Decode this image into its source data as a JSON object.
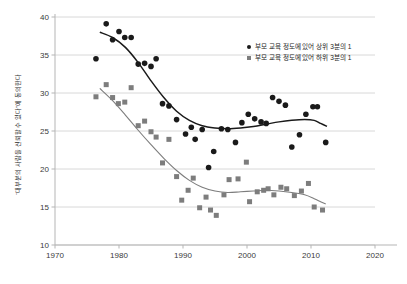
{
  "chart_data": {
    "type": "scatter",
    "title": "",
    "xlabel": "",
    "ylabel": "“대부분의 사람을 신뢰할 수 있다”에 동의한다",
    "xlim": [
      1970,
      2020
    ],
    "ylim": [
      10,
      40
    ],
    "xticks": [
      1970,
      1980,
      1990,
      2000,
      2010,
      2020
    ],
    "yticks": [
      10,
      15,
      20,
      25,
      30,
      35,
      40
    ],
    "grid": "horizontal",
    "legend_position": "top-right",
    "series": [
      {
        "name": "부모 교육 정도에 있어 상위 3분의 1",
        "marker": "circle",
        "color": "#1a1a1a",
        "points": [
          [
            1976.4,
            34.5
          ],
          [
            1978.0,
            39.1
          ],
          [
            1979.0,
            37.0
          ],
          [
            1980.0,
            38.1
          ],
          [
            1980.9,
            37.3
          ],
          [
            1981.9,
            37.3
          ],
          [
            1983.0,
            33.8
          ],
          [
            1984.0,
            33.9
          ],
          [
            1985.0,
            33.5
          ],
          [
            1985.8,
            34.5
          ],
          [
            1986.8,
            28.6
          ],
          [
            1987.8,
            28.3
          ],
          [
            1989.0,
            26.5
          ],
          [
            1990.4,
            24.6
          ],
          [
            1991.3,
            25.5
          ],
          [
            1991.9,
            23.9
          ],
          [
            1993.0,
            25.2
          ],
          [
            1994.0,
            20.2
          ],
          [
            1994.8,
            22.3
          ],
          [
            1996.0,
            25.3
          ],
          [
            1997.0,
            25.2
          ],
          [
            1998.2,
            23.5
          ],
          [
            1999.2,
            26.1
          ],
          [
            2000.2,
            27.2
          ],
          [
            2001.2,
            26.6
          ],
          [
            2002.2,
            26.2
          ],
          [
            2003.0,
            26.0
          ],
          [
            2004.0,
            29.4
          ],
          [
            2005.0,
            28.9
          ],
          [
            2006.0,
            28.4
          ],
          [
            2007.0,
            22.9
          ],
          [
            2008.2,
            24.5
          ],
          [
            2009.2,
            27.2
          ],
          [
            2010.3,
            28.2
          ],
          [
            2011.0,
            28.2
          ],
          [
            2012.3,
            23.5
          ]
        ],
        "trend": [
          [
            1977.0,
            38.0
          ],
          [
            1979.0,
            37.3
          ],
          [
            1981.0,
            36.0
          ],
          [
            1983.0,
            34.0
          ],
          [
            1985.0,
            31.6
          ],
          [
            1987.0,
            29.4
          ],
          [
            1989.0,
            27.6
          ],
          [
            1991.0,
            26.4
          ],
          [
            1993.0,
            25.7
          ],
          [
            1995.0,
            25.4
          ],
          [
            1997.0,
            25.3
          ],
          [
            1999.0,
            25.4
          ],
          [
            2001.0,
            25.6
          ],
          [
            2003.0,
            25.9
          ],
          [
            2005.0,
            26.2
          ],
          [
            2007.0,
            26.4
          ],
          [
            2009.0,
            26.5
          ],
          [
            2010.5,
            26.4
          ],
          [
            2011.5,
            26.0
          ],
          [
            2012.5,
            25.6
          ]
        ]
      },
      {
        "name": "부모 교육 정도에 있어 하위 3분의 1",
        "marker": "square",
        "color": "#7d7d7d",
        "points": [
          [
            1976.4,
            29.5
          ],
          [
            1978.0,
            31.1
          ],
          [
            1979.0,
            29.4
          ],
          [
            1979.9,
            28.6
          ],
          [
            1980.9,
            28.8
          ],
          [
            1981.9,
            30.7
          ],
          [
            1983.0,
            25.7
          ],
          [
            1984.0,
            26.3
          ],
          [
            1985.0,
            24.9
          ],
          [
            1985.8,
            24.2
          ],
          [
            1986.8,
            20.8
          ],
          [
            1987.8,
            23.9
          ],
          [
            1989.0,
            19.0
          ],
          [
            1989.8,
            15.9
          ],
          [
            1990.8,
            17.2
          ],
          [
            1991.6,
            18.8
          ],
          [
            1992.6,
            14.9
          ],
          [
            1993.6,
            16.3
          ],
          [
            1994.3,
            14.6
          ],
          [
            1995.2,
            13.9
          ],
          [
            1996.4,
            16.6
          ],
          [
            1997.2,
            18.6
          ],
          [
            1998.6,
            18.7
          ],
          [
            1999.9,
            20.9
          ],
          [
            2000.4,
            15.7
          ],
          [
            2001.6,
            17.0
          ],
          [
            2002.6,
            17.2
          ],
          [
            2003.3,
            17.4
          ],
          [
            2004.2,
            16.6
          ],
          [
            2005.3,
            17.6
          ],
          [
            2006.2,
            17.4
          ],
          [
            2007.4,
            16.5
          ],
          [
            2008.5,
            17.1
          ],
          [
            2009.6,
            18.1
          ],
          [
            2010.5,
            15.0
          ],
          [
            2011.8,
            14.6
          ]
        ],
        "trend": [
          [
            1977.0,
            30.6
          ],
          [
            1979.0,
            29.0
          ],
          [
            1981.0,
            27.1
          ],
          [
            1983.0,
            25.1
          ],
          [
            1985.0,
            23.2
          ],
          [
            1987.0,
            21.4
          ],
          [
            1989.0,
            19.8
          ],
          [
            1991.0,
            18.5
          ],
          [
            1993.0,
            17.6
          ],
          [
            1995.0,
            17.1
          ],
          [
            1997.0,
            16.9
          ],
          [
            1999.0,
            17.0
          ],
          [
            2001.0,
            17.1
          ],
          [
            2003.0,
            17.2
          ],
          [
            2005.0,
            17.1
          ],
          [
            2007.0,
            16.9
          ],
          [
            2009.0,
            16.6
          ],
          [
            2010.5,
            16.1
          ],
          [
            2011.5,
            15.7
          ],
          [
            2012.3,
            15.4
          ]
        ]
      }
    ],
    "colors": {
      "upper_third": "#1a1a1a",
      "lower_third": "#7d7d7d",
      "gridline": "#d4d4d4",
      "axis": "#b5b5b5",
      "text": "#3a3a3a",
      "background": "#ffffff"
    }
  },
  "axis": {
    "y_title": "“대부분의 사람을 신뢰할 수 있다”에 동의한다"
  },
  "legend": {
    "items": [
      {
        "label": "부모 교육 정도에 있어 상위 3분의 1",
        "marker": "circle"
      },
      {
        "label": "부모 교육 정도에 있어 하위 3분의 1",
        "marker": "square"
      }
    ]
  }
}
